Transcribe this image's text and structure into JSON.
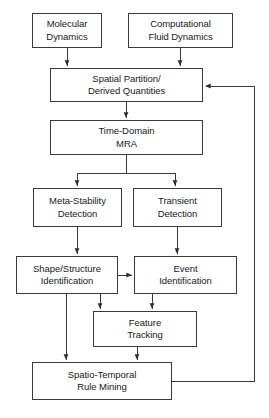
{
  "diagram": {
    "type": "flowchart",
    "background_color": "#ffffff",
    "border_color": "#3a3a3a",
    "text_color": "#1a1a1a",
    "nodes": [
      {
        "id": "molecular-dynamics",
        "lines": [
          "Molecular",
          "Dynamics"
        ],
        "x": 32,
        "y": 13,
        "w": 70,
        "h": 35
      },
      {
        "id": "computational-fluid-dynamics",
        "lines": [
          "Computational",
          "Fluid Dynamics"
        ],
        "x": 128,
        "y": 13,
        "w": 105,
        "h": 35
      },
      {
        "id": "spatial-partition-derived-quantities",
        "lines": [
          "Spatial Partition/",
          "Derived Quantities"
        ],
        "x": 50,
        "y": 68,
        "w": 153,
        "h": 34
      },
      {
        "id": "time-domain-mra",
        "lines": [
          "Time-Domain",
          "MRA"
        ],
        "x": 50,
        "y": 120,
        "w": 153,
        "h": 35
      },
      {
        "id": "meta-stability-detection",
        "lines": [
          "Meta-Stability",
          "Detection"
        ],
        "x": 33,
        "y": 188,
        "w": 89,
        "h": 39
      },
      {
        "id": "transient-detection",
        "lines": [
          "Transient",
          "Detection"
        ],
        "x": 133,
        "y": 188,
        "w": 89,
        "h": 39
      },
      {
        "id": "shape-structure-identification",
        "lines": [
          "Shape/Structure",
          "Identification"
        ],
        "x": 16,
        "y": 256,
        "w": 102,
        "h": 38
      },
      {
        "id": "event-identification",
        "lines": [
          "Event",
          "Identification"
        ],
        "x": 134,
        "y": 256,
        "w": 103,
        "h": 38
      },
      {
        "id": "feature-tracking",
        "lines": [
          "Feature",
          "Tracking"
        ],
        "x": 93,
        "y": 311,
        "w": 104,
        "h": 36
      },
      {
        "id": "spatio-temporal-rule-mining",
        "lines": [
          "Spatio-Temporal",
          "Rule Mining"
        ],
        "x": 32,
        "y": 362,
        "w": 140,
        "h": 38
      }
    ],
    "edges": [
      {
        "id": "edge-molecular-to-spatial",
        "from": "molecular-dynamics",
        "to": "spatial-partition-derived-quantities"
      },
      {
        "id": "edge-cfd-to-spatial",
        "from": "computational-fluid-dynamics",
        "to": "spatial-partition-derived-quantities"
      },
      {
        "id": "edge-spatial-to-mra",
        "from": "spatial-partition-derived-quantities",
        "to": "time-domain-mra"
      },
      {
        "id": "edge-mra-to-metastability",
        "from": "time-domain-mra",
        "to": "meta-stability-detection"
      },
      {
        "id": "edge-mra-to-transient",
        "from": "time-domain-mra",
        "to": "transient-detection"
      },
      {
        "id": "edge-metastability-to-shape",
        "from": "meta-stability-detection",
        "to": "shape-structure-identification"
      },
      {
        "id": "edge-transient-to-event",
        "from": "transient-detection",
        "to": "event-identification"
      },
      {
        "id": "edge-shape-to-event",
        "from": "shape-structure-identification",
        "to": "event-identification"
      },
      {
        "id": "edge-shape-to-feature",
        "from": "shape-structure-identification",
        "to": "feature-tracking"
      },
      {
        "id": "edge-event-to-feature",
        "from": "event-identification",
        "to": "feature-tracking"
      },
      {
        "id": "edge-shape-to-rulemining",
        "from": "shape-structure-identification",
        "to": "spatio-temporal-rule-mining"
      },
      {
        "id": "edge-feature-to-rulemining",
        "from": "feature-tracking",
        "to": "spatio-temporal-rule-mining"
      },
      {
        "id": "edge-rulemining-feedback-to-spatial",
        "from": "spatio-temporal-rule-mining",
        "to": "spatial-partition-derived-quantities",
        "style": "feedback-loop"
      }
    ]
  }
}
